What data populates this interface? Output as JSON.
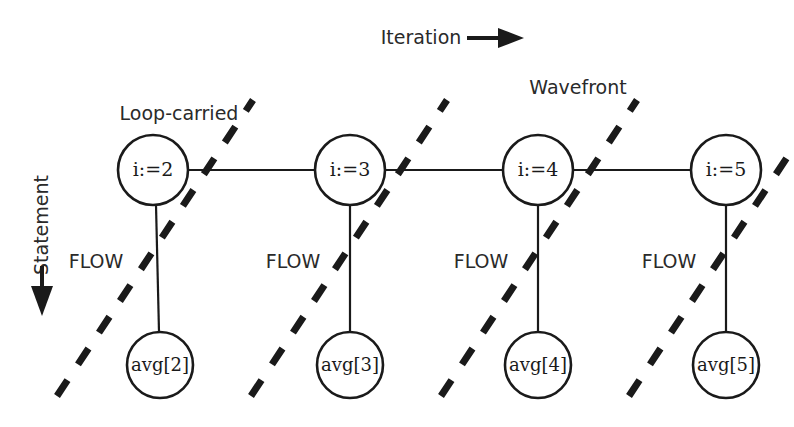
{
  "figure": {
    "title_axis_horizontal": "Iteration",
    "title_axis_vertical": "Statement",
    "annotation_loop_carried": "Loop-carried",
    "annotation_wavefront": "Wavefront",
    "edge_label_flow": "FLOW",
    "ink_color": "#1a1a1a",
    "text_color": "#2a2a2a",
    "background_color": "#ffffff"
  },
  "nodes": {
    "statements_row1": [
      {
        "id": "i2",
        "label": "i:=2",
        "cx": 153,
        "cy": 170,
        "r": 35
      },
      {
        "id": "i3",
        "label": "i:=3",
        "cx": 350,
        "cy": 170,
        "r": 35
      },
      {
        "id": "i4",
        "label": "i:=4",
        "cx": 538,
        "cy": 170,
        "r": 35
      },
      {
        "id": "i5",
        "label": "i:=5",
        "cx": 726,
        "cy": 170,
        "r": 35
      }
    ],
    "statements_row2": [
      {
        "id": "avg2",
        "label": "avg[2]",
        "cx": 160,
        "cy": 365,
        "r": 33
      },
      {
        "id": "avg3",
        "label": "avg[3]",
        "cx": 350,
        "cy": 365,
        "r": 33
      },
      {
        "id": "avg4",
        "label": "avg[4]",
        "cx": 538,
        "cy": 365,
        "r": 33
      },
      {
        "id": "avg5",
        "label": "avg[5]",
        "cx": 726,
        "cy": 365,
        "r": 33
      }
    ]
  },
  "edges": {
    "horizontal_loop_carried": [
      {
        "from": "i2",
        "to": "i3"
      },
      {
        "from": "i3",
        "to": "i4"
      },
      {
        "from": "i4",
        "to": "i5"
      }
    ],
    "vertical_flow": [
      {
        "from": "i2",
        "to": "avg2",
        "label": "FLOW",
        "label_x": 96,
        "label_y": 262
      },
      {
        "from": "i3",
        "to": "avg3",
        "label": "FLOW",
        "label_x": 293,
        "label_y": 262
      },
      {
        "from": "i4",
        "to": "avg4",
        "label": "FLOW",
        "label_x": 481,
        "label_y": 262
      },
      {
        "from": "i5",
        "to": "avg5",
        "label": "FLOW",
        "label_x": 669,
        "label_y": 262
      }
    ]
  },
  "wavefronts": [
    {
      "id": "wf1",
      "x1": 57,
      "y1": 396,
      "x2": 253,
      "y2": 100
    },
    {
      "id": "wf2",
      "x1": 251,
      "y1": 396,
      "x2": 447,
      "y2": 100
    },
    {
      "id": "wf3",
      "x1": 441,
      "y1": 396,
      "x2": 637,
      "y2": 100
    },
    {
      "id": "wf4",
      "x1": 629,
      "y1": 396,
      "x2": 794,
      "y2": 147
    }
  ],
  "axes": {
    "horizontal": {
      "label": "Iteration",
      "label_x": 421,
      "label_y": 37,
      "shaft_x1": 467,
      "shaft_x2": 500,
      "tip_x": 523,
      "y": 37
    },
    "vertical": {
      "label": "Statement",
      "label_x": 42,
      "label_y": 225,
      "shaft_y1": 267,
      "shaft_y2": 288,
      "tip_y": 315,
      "x": 42
    }
  },
  "annotations": [
    {
      "id": "loop-carried",
      "text": "Loop-carried",
      "x": 179,
      "y": 114
    },
    {
      "id": "wavefront",
      "text": "Wavefront",
      "x": 578,
      "y": 88
    }
  ]
}
